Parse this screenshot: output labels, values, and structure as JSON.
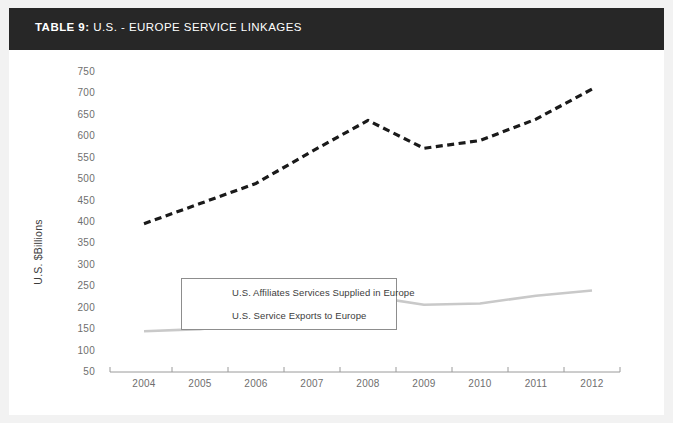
{
  "title": {
    "prefix": "TABLE 9:",
    "rest": " U.S. - EUROPE SERVICE LINKAGES"
  },
  "colors": {
    "title_bar_bg": "#272727",
    "page_bg": "#f2f2f2",
    "card_bg": "#ffffff",
    "series_affiliates": "#1a1a1a",
    "series_exports": "#c9c9c9",
    "axis": "#9a9a9a",
    "tick_text": "#6e6e6e"
  },
  "chart_data": {
    "type": "line",
    "title": "TABLE 9: U.S. - EUROPE SERVICE LINKAGES",
    "xlabel": "",
    "ylabel": "U.S. $Billions",
    "categories": [
      "2004",
      "2005",
      "2006",
      "2007",
      "2008",
      "2009",
      "2010",
      "2011",
      "2012"
    ],
    "x": [
      2004,
      2005,
      2006,
      2007,
      2008,
      2009,
      2010,
      2011,
      2012
    ],
    "ylim": [
      50,
      750
    ],
    "ytick_step": 50,
    "yticks": [
      750,
      700,
      650,
      600,
      550,
      500,
      450,
      400,
      350,
      300,
      250,
      200,
      150,
      100,
      50
    ],
    "grid": false,
    "legend_position": "center-left",
    "series": [
      {
        "name": "U.S. Affiliates Services Supplied in Europe",
        "style": "dashed",
        "color": "#1a1a1a",
        "values": [
          396,
          443,
          490,
          565,
          637,
          572,
          590,
          640,
          710
        ]
      },
      {
        "name": "U.S. Service Exports to Europe",
        "style": "solid",
        "color": "#c9c9c9",
        "values": [
          145,
          150,
          165,
          190,
          227,
          207,
          210,
          228,
          240
        ]
      }
    ]
  }
}
